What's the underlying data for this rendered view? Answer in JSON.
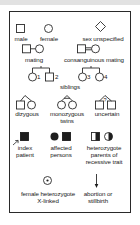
{
  "legend": {
    "title": "",
    "items": {
      "male": "male",
      "female": "female",
      "sex_unspecified": "sex unspecified",
      "mating": "mating",
      "consanguineous_mating": "consanguinous mating",
      "siblings": "siblings",
      "sibling_numbers": [
        "1",
        "2",
        "3",
        "4"
      ],
      "dizygous": "dizygous",
      "monozygous": "monozygous",
      "twins": "twins",
      "uncertain": "uncertain",
      "uncertain_mark": "?",
      "index_patient_1": "index",
      "index_patient_2": "patient",
      "affected_persons_1": "affected",
      "affected_persons_2": "persons",
      "heterozygote_1": "heterozygote",
      "heterozygote_2": "parents of",
      "heterozygote_3": "recessive trait",
      "female_het_1": "female heterozygote",
      "female_het_2": "X-linked",
      "abortion_1": "abortion or",
      "abortion_2": "stillbirth"
    }
  },
  "colors": {
    "stroke": "#2a2a2a",
    "fill_affected": "#1e1e1e",
    "top_band": "#e2e2e2"
  }
}
